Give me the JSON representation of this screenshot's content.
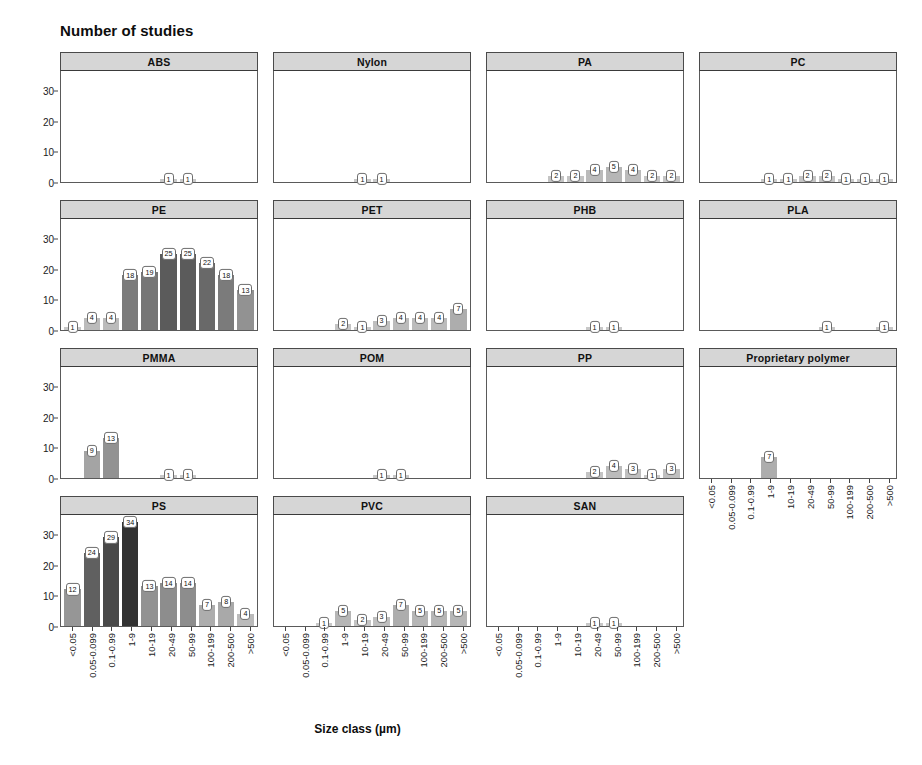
{
  "figure": {
    "title": "Number of studies",
    "x_axis_title": "Size class (µm)"
  },
  "chart_data": {
    "type": "bar",
    "title": "Number of studies",
    "xlabel": "Size class (µm)",
    "ylabel": "Number of studies",
    "ylim": [
      0,
      36
    ],
    "yticks": [
      0,
      10,
      20,
      30
    ],
    "grid": false,
    "legend": "none",
    "layout": "faceted 4 columns x 4 rows, shared axes",
    "categories": [
      "<0.05",
      "0.05-0.099",
      "0.1-0.99",
      "1-9",
      "10-19",
      "20-49",
      "50-99",
      "100-199",
      "200-500",
      ">500"
    ],
    "panels": [
      {
        "name": "ABS",
        "values": [
          null,
          null,
          null,
          null,
          null,
          1,
          1,
          null,
          null,
          null
        ]
      },
      {
        "name": "Nylon",
        "values": [
          null,
          null,
          null,
          null,
          1,
          1,
          null,
          null,
          null,
          null
        ]
      },
      {
        "name": "PA",
        "values": [
          null,
          null,
          null,
          2,
          2,
          4,
          5,
          4,
          2,
          2
        ]
      },
      {
        "name": "PC",
        "values": [
          null,
          null,
          null,
          1,
          1,
          2,
          2,
          1,
          1,
          1
        ]
      },
      {
        "name": "PE",
        "values": [
          1,
          4,
          4,
          18,
          19,
          25,
          25,
          22,
          18,
          13
        ]
      },
      {
        "name": "PET",
        "values": [
          null,
          null,
          null,
          2,
          1,
          3,
          4,
          4,
          4,
          7
        ]
      },
      {
        "name": "PHB",
        "values": [
          null,
          null,
          null,
          null,
          null,
          1,
          1,
          null,
          null,
          null
        ]
      },
      {
        "name": "PLA",
        "values": [
          null,
          null,
          null,
          null,
          null,
          null,
          1,
          null,
          null,
          1
        ]
      },
      {
        "name": "PMMA",
        "values": [
          null,
          9,
          13,
          null,
          null,
          1,
          1,
          null,
          null,
          null
        ]
      },
      {
        "name": "POM",
        "values": [
          null,
          null,
          null,
          null,
          null,
          1,
          1,
          null,
          null,
          null
        ]
      },
      {
        "name": "PP",
        "values": [
          null,
          null,
          null,
          null,
          null,
          2,
          4,
          3,
          1,
          3
        ]
      },
      {
        "name": "Proprietary polymer",
        "values": [
          null,
          null,
          null,
          7,
          null,
          null,
          null,
          null,
          null,
          null
        ]
      },
      {
        "name": "PS",
        "values": [
          12,
          24,
          29,
          34,
          13,
          14,
          14,
          7,
          8,
          4
        ]
      },
      {
        "name": "PVC",
        "values": [
          null,
          null,
          1,
          5,
          2,
          3,
          7,
          5,
          5,
          5
        ]
      },
      {
        "name": "SAN",
        "values": [
          null,
          null,
          null,
          null,
          null,
          1,
          1,
          null,
          null,
          null
        ]
      }
    ]
  }
}
